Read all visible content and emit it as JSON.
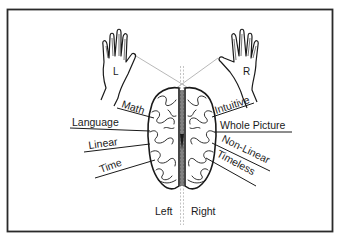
{
  "diagram": {
    "hands": {
      "left": {
        "label": "L"
      },
      "right": {
        "label": "R"
      }
    },
    "left_hemisphere": {
      "label": "Left",
      "functions": [
        "Math",
        "Language",
        "Linear",
        "Time"
      ]
    },
    "right_hemisphere": {
      "label": "Right",
      "functions": [
        "Intuitive",
        "Whole Picture",
        "Non-Linear",
        "Timeless"
      ]
    },
    "colors": {
      "ink": "#1a1a1a",
      "background": "#ffffff",
      "frame": "#2a2a2a",
      "guide": "#9a9a9a"
    }
  }
}
